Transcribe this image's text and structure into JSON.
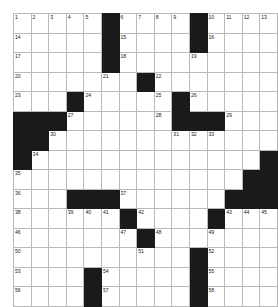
{
  "puzzle": {
    "type": "crossword-grid",
    "columns": 15,
    "rows": 14,
    "colors": {
      "block": "#1a1a1a",
      "open": "#ffffff",
      "gridline": "#b9b9b9",
      "number_text": "#1c1c1c"
    },
    "grid": [
      [
        {
          "b": false,
          "n": "1"
        },
        {
          "b": false,
          "n": "2"
        },
        {
          "b": false,
          "n": "3"
        },
        {
          "b": false,
          "n": "4"
        },
        {
          "b": false,
          "n": "5"
        },
        {
          "b": true,
          "n": ""
        },
        {
          "b": false,
          "n": "6"
        },
        {
          "b": false,
          "n": "7"
        },
        {
          "b": false,
          "n": "8"
        },
        {
          "b": false,
          "n": "9"
        },
        {
          "b": true,
          "n": ""
        },
        {
          "b": false,
          "n": "10"
        },
        {
          "b": false,
          "n": "11"
        },
        {
          "b": false,
          "n": "12"
        },
        {
          "b": false,
          "n": "13"
        }
      ],
      [
        {
          "b": false,
          "n": "14"
        },
        {
          "b": false,
          "n": ""
        },
        {
          "b": false,
          "n": ""
        },
        {
          "b": false,
          "n": ""
        },
        {
          "b": false,
          "n": ""
        },
        {
          "b": true,
          "n": ""
        },
        {
          "b": false,
          "n": "15"
        },
        {
          "b": false,
          "n": ""
        },
        {
          "b": false,
          "n": ""
        },
        {
          "b": false,
          "n": ""
        },
        {
          "b": true,
          "n": ""
        },
        {
          "b": false,
          "n": "16"
        },
        {
          "b": false,
          "n": ""
        },
        {
          "b": false,
          "n": ""
        },
        {
          "b": false,
          "n": ""
        }
      ],
      [
        {
          "b": false,
          "n": "17"
        },
        {
          "b": false,
          "n": ""
        },
        {
          "b": false,
          "n": ""
        },
        {
          "b": false,
          "n": ""
        },
        {
          "b": false,
          "n": ""
        },
        {
          "b": true,
          "n": ""
        },
        {
          "b": false,
          "n": "18"
        },
        {
          "b": false,
          "n": ""
        },
        {
          "b": false,
          "n": ""
        },
        {
          "b": false,
          "n": ""
        },
        {
          "b": false,
          "n": "19"
        },
        {
          "b": false,
          "n": ""
        },
        {
          "b": false,
          "n": ""
        },
        {
          "b": false,
          "n": ""
        },
        {
          "b": false,
          "n": ""
        }
      ],
      [
        {
          "b": false,
          "n": "20"
        },
        {
          "b": false,
          "n": ""
        },
        {
          "b": false,
          "n": ""
        },
        {
          "b": false,
          "n": ""
        },
        {
          "b": false,
          "n": ""
        },
        {
          "b": false,
          "n": "21"
        },
        {
          "b": false,
          "n": ""
        },
        {
          "b": true,
          "n": ""
        },
        {
          "b": false,
          "n": "22"
        },
        {
          "b": false,
          "n": ""
        },
        {
          "b": false,
          "n": ""
        },
        {
          "b": false,
          "n": ""
        },
        {
          "b": false,
          "n": ""
        },
        {
          "b": false,
          "n": ""
        },
        {
          "b": false,
          "n": ""
        }
      ],
      [
        {
          "b": false,
          "n": "23"
        },
        {
          "b": false,
          "n": ""
        },
        {
          "b": false,
          "n": ""
        },
        {
          "b": true,
          "n": ""
        },
        {
          "b": false,
          "n": "24"
        },
        {
          "b": false,
          "n": ""
        },
        {
          "b": false,
          "n": ""
        },
        {
          "b": false,
          "n": ""
        },
        {
          "b": false,
          "n": "25"
        },
        {
          "b": true,
          "n": ""
        },
        {
          "b": false,
          "n": "26"
        },
        {
          "b": false,
          "n": ""
        },
        {
          "b": false,
          "n": ""
        },
        {
          "b": false,
          "n": ""
        },
        {
          "b": false,
          "n": ""
        }
      ],
      [
        {
          "b": true,
          "n": ""
        },
        {
          "b": true,
          "n": ""
        },
        {
          "b": true,
          "n": ""
        },
        {
          "b": false,
          "n": "27"
        },
        {
          "b": false,
          "n": ""
        },
        {
          "b": false,
          "n": ""
        },
        {
          "b": false,
          "n": ""
        },
        {
          "b": false,
          "n": ""
        },
        {
          "b": false,
          "n": "28"
        },
        {
          "b": true,
          "n": ""
        },
        {
          "b": true,
          "n": ""
        },
        {
          "b": true,
          "n": ""
        },
        {
          "b": false,
          "n": "29"
        },
        {
          "b": false,
          "n": ""
        },
        {
          "b": false,
          "n": ""
        }
      ],
      [
        {
          "b": true,
          "n": ""
        },
        {
          "b": true,
          "n": ""
        },
        {
          "b": false,
          "n": "30"
        },
        {
          "b": false,
          "n": ""
        },
        {
          "b": false,
          "n": ""
        },
        {
          "b": false,
          "n": ""
        },
        {
          "b": false,
          "n": ""
        },
        {
          "b": false,
          "n": ""
        },
        {
          "b": false,
          "n": ""
        },
        {
          "b": false,
          "n": "31"
        },
        {
          "b": false,
          "n": "32"
        },
        {
          "b": false,
          "n": "33"
        },
        {
          "b": false,
          "n": ""
        },
        {
          "b": false,
          "n": ""
        },
        {
          "b": false,
          "n": ""
        }
      ],
      [
        {
          "b": true,
          "n": ""
        },
        {
          "b": false,
          "n": "34"
        },
        {
          "b": false,
          "n": ""
        },
        {
          "b": false,
          "n": ""
        },
        {
          "b": false,
          "n": ""
        },
        {
          "b": false,
          "n": ""
        },
        {
          "b": false,
          "n": ""
        },
        {
          "b": false,
          "n": ""
        },
        {
          "b": false,
          "n": ""
        },
        {
          "b": false,
          "n": ""
        },
        {
          "b": false,
          "n": ""
        },
        {
          "b": false,
          "n": ""
        },
        {
          "b": false,
          "n": ""
        },
        {
          "b": false,
          "n": ""
        },
        {
          "b": true,
          "n": ""
        }
      ],
      [
        {
          "b": false,
          "n": "35"
        },
        {
          "b": false,
          "n": ""
        },
        {
          "b": false,
          "n": ""
        },
        {
          "b": false,
          "n": ""
        },
        {
          "b": false,
          "n": ""
        },
        {
          "b": false,
          "n": ""
        },
        {
          "b": false,
          "n": ""
        },
        {
          "b": false,
          "n": ""
        },
        {
          "b": false,
          "n": ""
        },
        {
          "b": false,
          "n": ""
        },
        {
          "b": false,
          "n": ""
        },
        {
          "b": false,
          "n": ""
        },
        {
          "b": false,
          "n": ""
        },
        {
          "b": true,
          "n": ""
        },
        {
          "b": true,
          "n": ""
        }
      ],
      [
        {
          "b": false,
          "n": "36"
        },
        {
          "b": false,
          "n": ""
        },
        {
          "b": false,
          "n": ""
        },
        {
          "b": true,
          "n": ""
        },
        {
          "b": true,
          "n": ""
        },
        {
          "b": true,
          "n": ""
        },
        {
          "b": false,
          "n": "37"
        },
        {
          "b": false,
          "n": ""
        },
        {
          "b": false,
          "n": ""
        },
        {
          "b": false,
          "n": ""
        },
        {
          "b": false,
          "n": ""
        },
        {
          "b": false,
          "n": ""
        },
        {
          "b": true,
          "n": ""
        },
        {
          "b": true,
          "n": ""
        },
        {
          "b": true,
          "n": ""
        }
      ],
      [
        {
          "b": false,
          "n": "38"
        },
        {
          "b": false,
          "n": ""
        },
        {
          "b": false,
          "n": ""
        },
        {
          "b": false,
          "n": "39"
        },
        {
          "b": false,
          "n": "40"
        },
        {
          "b": false,
          "n": "41"
        },
        {
          "b": true,
          "n": ""
        },
        {
          "b": false,
          "n": "42"
        },
        {
          "b": false,
          "n": ""
        },
        {
          "b": false,
          "n": ""
        },
        {
          "b": false,
          "n": ""
        },
        {
          "b": true,
          "n": ""
        },
        {
          "b": false,
          "n": "43"
        },
        {
          "b": false,
          "n": "44"
        },
        {
          "b": false,
          "n": "45"
        }
      ],
      [
        {
          "b": false,
          "n": "46"
        },
        {
          "b": false,
          "n": ""
        },
        {
          "b": false,
          "n": ""
        },
        {
          "b": false,
          "n": ""
        },
        {
          "b": false,
          "n": ""
        },
        {
          "b": false,
          "n": ""
        },
        {
          "b": false,
          "n": "47"
        },
        {
          "b": true,
          "n": ""
        },
        {
          "b": false,
          "n": "48"
        },
        {
          "b": false,
          "n": ""
        },
        {
          "b": false,
          "n": ""
        },
        {
          "b": false,
          "n": "49"
        },
        {
          "b": false,
          "n": ""
        },
        {
          "b": false,
          "n": ""
        },
        {
          "b": false,
          "n": ""
        }
      ],
      [
        {
          "b": false,
          "n": "50"
        },
        {
          "b": false,
          "n": ""
        },
        {
          "b": false,
          "n": ""
        },
        {
          "b": false,
          "n": ""
        },
        {
          "b": false,
          "n": ""
        },
        {
          "b": false,
          "n": ""
        },
        {
          "b": false,
          "n": ""
        },
        {
          "b": false,
          "n": "51"
        },
        {
          "b": false,
          "n": ""
        },
        {
          "b": false,
          "n": ""
        },
        {
          "b": true,
          "n": ""
        },
        {
          "b": false,
          "n": "52"
        },
        {
          "b": false,
          "n": ""
        },
        {
          "b": false,
          "n": ""
        },
        {
          "b": false,
          "n": ""
        }
      ],
      [
        {
          "b": false,
          "n": "53"
        },
        {
          "b": false,
          "n": ""
        },
        {
          "b": false,
          "n": ""
        },
        {
          "b": false,
          "n": ""
        },
        {
          "b": true,
          "n": ""
        },
        {
          "b": false,
          "n": "54"
        },
        {
          "b": false,
          "n": ""
        },
        {
          "b": false,
          "n": ""
        },
        {
          "b": false,
          "n": ""
        },
        {
          "b": false,
          "n": ""
        },
        {
          "b": true,
          "n": ""
        },
        {
          "b": false,
          "n": "55"
        },
        {
          "b": false,
          "n": ""
        },
        {
          "b": false,
          "n": ""
        },
        {
          "b": false,
          "n": ""
        }
      ],
      [
        {
          "b": false,
          "n": "56"
        },
        {
          "b": false,
          "n": ""
        },
        {
          "b": false,
          "n": ""
        },
        {
          "b": false,
          "n": ""
        },
        {
          "b": true,
          "n": ""
        },
        {
          "b": false,
          "n": "57"
        },
        {
          "b": false,
          "n": ""
        },
        {
          "b": false,
          "n": ""
        },
        {
          "b": false,
          "n": ""
        },
        {
          "b": false,
          "n": ""
        },
        {
          "b": true,
          "n": ""
        },
        {
          "b": false,
          "n": "58"
        },
        {
          "b": false,
          "n": ""
        },
        {
          "b": false,
          "n": ""
        },
        {
          "b": false,
          "n": ""
        }
      ]
    ]
  }
}
